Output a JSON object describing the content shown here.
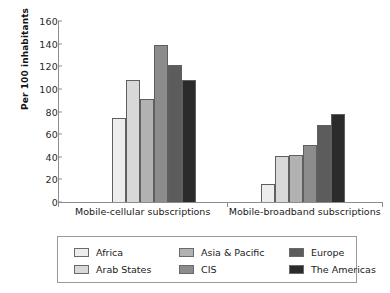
{
  "chart_data": {
    "type": "bar",
    "title": "",
    "xlabel": "",
    "ylabel": "Per 100 inhabitants",
    "ylim": [
      0,
      160
    ],
    "yticks": [
      0,
      20,
      40,
      60,
      80,
      100,
      120,
      140,
      160
    ],
    "grid": false,
    "legend_position": "bottom",
    "categories": [
      "Mobile-cellular subscriptions",
      "Mobile-broadband subscriptions"
    ],
    "series": [
      {
        "name": "Africa",
        "color": "#ededed",
        "values": [
          74,
          16
        ]
      },
      {
        "name": "Arab States",
        "color": "#d8d8d8",
        "values": [
          108,
          41
        ]
      },
      {
        "name": "Asia & Pacific",
        "color": "#b2b2b2",
        "values": [
          91,
          42
        ]
      },
      {
        "name": "CIS",
        "color": "#8c8c8c",
        "values": [
          139,
          50
        ]
      },
      {
        "name": "Europe",
        "color": "#5c5c5c",
        "values": [
          121,
          68
        ]
      },
      {
        "name": "The Americas",
        "color": "#2b2b2b",
        "values": [
          108,
          78
        ]
      }
    ]
  },
  "legend": {
    "entries": [
      {
        "label": "Africa",
        "color": "#ededed"
      },
      {
        "label": "Asia & Pacific",
        "color": "#b2b2b2"
      },
      {
        "label": "Europe",
        "color": "#5c5c5c"
      },
      {
        "label": "Arab States",
        "color": "#d8d8d8"
      },
      {
        "label": "CIS",
        "color": "#8c8c8c"
      },
      {
        "label": "The Americas",
        "color": "#2b2b2b"
      }
    ]
  },
  "colors": {
    "axis": "#8d8d8d",
    "text": "#1a1a1a",
    "bar_outline": "#5f5f5f",
    "legend_border": "#9a9a9a",
    "background": "#ffffff"
  }
}
